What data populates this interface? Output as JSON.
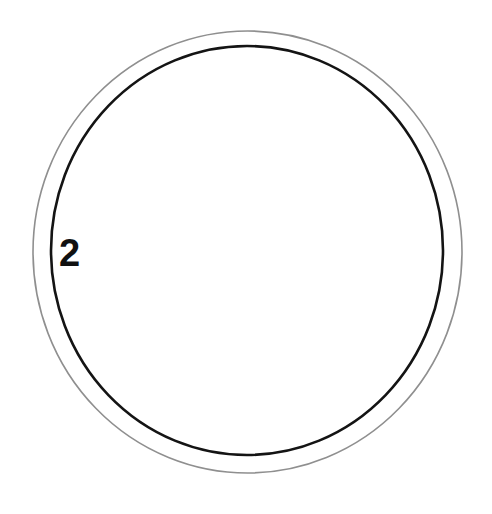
{
  "figure": {
    "background_color": "#ffffff",
    "width": 492,
    "height": 514
  },
  "chart_data": {
    "type": "diagram",
    "title": "",
    "subtitle": "",
    "xlabel": "",
    "ylabel": "",
    "grid": false,
    "legend": false,
    "shapes": [
      {
        "name": "outer-circle",
        "kind": "ellipse",
        "cx": 247.5,
        "cy": 252.0,
        "rx": 214.5,
        "ry": 221.0,
        "stroke": "#8f8f8f",
        "stroke_width": 1.6,
        "fill": "none"
      },
      {
        "name": "inner-circle",
        "kind": "ellipse",
        "cx": 247.0,
        "cy": 250.5,
        "rx": 196.0,
        "ry": 204.5,
        "stroke": "#141414",
        "stroke_width": 2.6,
        "fill": "none"
      }
    ],
    "annotations": [
      {
        "name": "label-2",
        "text": "2",
        "x": 70,
        "y": 254,
        "font_size": 38,
        "bold": true,
        "color": "#111111",
        "attached_to": "inner-circle"
      }
    ]
  },
  "labels": {
    "circle_label": "2"
  },
  "colors": {
    "outer_stroke": "#8f8f8f",
    "inner_stroke": "#141414",
    "label": "#111111",
    "background": "#ffffff"
  }
}
